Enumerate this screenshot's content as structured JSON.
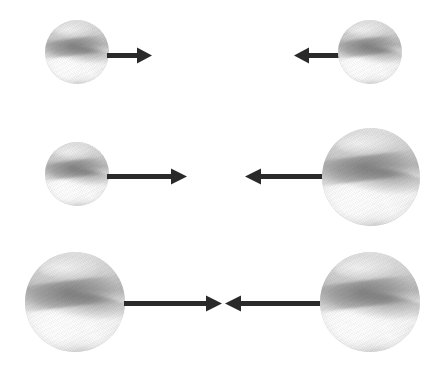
{
  "figure": {
    "background_color": "#ffffff",
    "width": 441,
    "height": 375,
    "arrow_color": "#2a2a2a",
    "sphere_label": "glass-sphere"
  },
  "rows": [
    {
      "id": "row-1",
      "description": "Two equal small spheres approaching each other with short equal arrows",
      "objects": [
        {
          "name": "sphere-left",
          "size": "small",
          "diameter": 64,
          "x": 45,
          "y": 20
        },
        {
          "name": "arrow-left",
          "direction": "right",
          "length": 46,
          "x": 107,
          "y": 46
        },
        {
          "name": "arrow-right",
          "direction": "left",
          "length": 46,
          "x": 293,
          "y": 46
        },
        {
          "name": "sphere-right",
          "size": "small",
          "diameter": 64,
          "x": 338,
          "y": 20
        }
      ]
    },
    {
      "id": "row-2",
      "description": "Small sphere on the left and large sphere on the right, each with a long arrow",
      "objects": [
        {
          "name": "sphere-left",
          "size": "small",
          "diameter": 64,
          "x": 45,
          "y": 142
        },
        {
          "name": "arrow-left",
          "direction": "right",
          "length": 80,
          "x": 107,
          "y": 167
        },
        {
          "name": "arrow-right",
          "direction": "left",
          "length": 80,
          "x": 244,
          "y": 167
        },
        {
          "name": "sphere-right",
          "size": "large",
          "diameter": 98,
          "x": 322,
          "y": 128
        }
      ]
    },
    {
      "id": "row-3",
      "description": "Two equal large spheres approaching each other with long arrows meeting in the middle",
      "objects": [
        {
          "name": "sphere-left",
          "size": "large",
          "diameter": 100,
          "x": 25,
          "y": 252
        },
        {
          "name": "arrow-left",
          "direction": "right",
          "length": 98,
          "x": 124,
          "y": 294
        },
        {
          "name": "arrow-right",
          "direction": "left",
          "length": 98,
          "x": 224,
          "y": 294
        },
        {
          "name": "sphere-right",
          "size": "large",
          "diameter": 100,
          "x": 320,
          "y": 252
        }
      ]
    }
  ]
}
